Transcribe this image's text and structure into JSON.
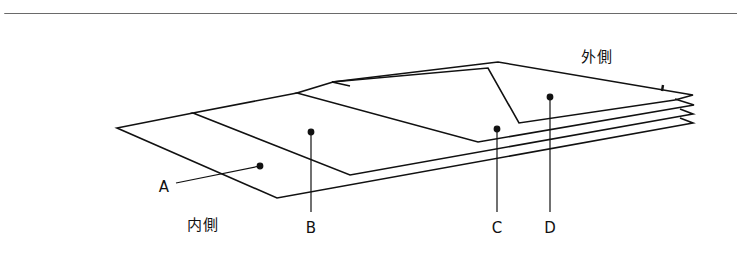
{
  "diagram": {
    "type": "layered-sheets",
    "side_labels": {
      "outer": "外側",
      "inner": "内側"
    },
    "sheets": [
      {
        "id": "A",
        "label": "A"
      },
      {
        "id": "B",
        "label": "B"
      },
      {
        "id": "C",
        "label": "C"
      },
      {
        "id": "D",
        "label": "D"
      }
    ],
    "colors": {
      "line": "#111111",
      "frame": "#6a6a6a",
      "background": "#ffffff"
    }
  }
}
